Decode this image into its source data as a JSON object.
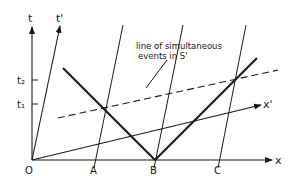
{
  "diagram": {
    "type": "spacetime-diagram",
    "colors": {
      "ink": "#1a1a1a",
      "background": "#ffffff"
    },
    "axes": {
      "t": {
        "label": "t"
      },
      "t_prime": {
        "label": "t'"
      },
      "x": {
        "label": "x"
      },
      "x_prime": {
        "label": "x'"
      },
      "origin": {
        "label": "O"
      }
    },
    "ticks": {
      "t1": {
        "label": "t₁"
      },
      "t2": {
        "label": "t₂"
      }
    },
    "points": {
      "A": {
        "label": "A"
      },
      "B": {
        "label": "B"
      },
      "C": {
        "label": "C"
      }
    },
    "annotation": {
      "line1": "line of simultaneous",
      "line2": "events in S'"
    }
  }
}
